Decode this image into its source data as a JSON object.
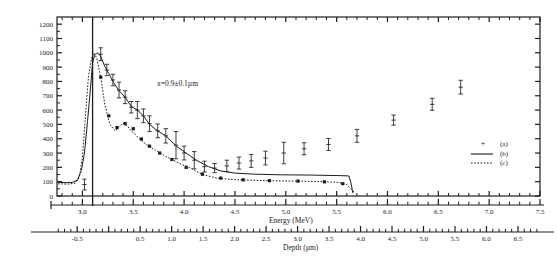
{
  "chart_data": {
    "type": "line",
    "title": "",
    "annotation": "x=0.9±0.1µm",
    "xlabel": "Energy (MeV)",
    "xlabel2": "Depth (µm)",
    "ylabel": "",
    "xlim": [
      2.75,
      7.5
    ],
    "ylim": [
      0,
      1250
    ],
    "xlim_depth": [
      -0.82,
      6.85
    ],
    "grid": false,
    "legend_position": "lower-right",
    "vertical_marker_energy": 3.1,
    "ytick_labels": [
      "0",
      "100",
      "200",
      "300",
      "400",
      "500",
      "600",
      "700",
      "800",
      "900",
      "1000",
      "1100",
      "1200"
    ],
    "ytick_values": [
      0,
      100,
      200,
      300,
      400,
      500,
      600,
      700,
      800,
      900,
      1000,
      1100,
      1200
    ],
    "xtick_labels": [
      "3.0",
      "3.5",
      "4.0",
      "4.5",
      "5.0",
      "5.5",
      "6.0",
      "6.5",
      "7.0",
      "7.5"
    ],
    "xtick_values": [
      3.0,
      3.5,
      4.0,
      4.5,
      5.0,
      5.5,
      6.0,
      6.5,
      7.0,
      7.5
    ],
    "xtick_minor_step": 0.1,
    "depth_tick_labels": [
      "-0.5",
      "0.5",
      "1.0",
      "1.5",
      "2.0",
      "2.5",
      "3.0",
      "3.5",
      "4.0",
      "4.5",
      "5.0",
      "5.5",
      "6.0",
      "6.5"
    ],
    "depth_tick_values": [
      -0.5,
      0.5,
      1.0,
      1.5,
      2.0,
      2.5,
      3.0,
      3.5,
      4.0,
      4.5,
      5.0,
      5.5,
      6.0,
      6.5
    ],
    "depth_tick_minor_step": 0.1,
    "legend": [
      {
        "marker": "+",
        "label": "(a)"
      },
      {
        "marker": "solid-line",
        "label": "(b)"
      },
      {
        "marker": "dotted-line",
        "label": "(c)"
      }
    ],
    "series": [
      {
        "name": "(a)",
        "style": "points-with-errorbars",
        "x": [
          3.02,
          3.18,
          3.24,
          3.3,
          3.36,
          3.42,
          3.48,
          3.54,
          3.6,
          3.66,
          3.74,
          3.82,
          3.92,
          4.0,
          4.1,
          4.2,
          4.3,
          4.42,
          4.54,
          4.66,
          4.8,
          4.98,
          5.18,
          5.42,
          5.7,
          6.06,
          6.44,
          6.72
        ],
        "y": [
          80,
          990,
          880,
          810,
          740,
          690,
          620,
          600,
          560,
          505,
          455,
          420,
          355,
          300,
          250,
          205,
          195,
          210,
          230,
          245,
          265,
          300,
          330,
          360,
          420,
          530,
          640,
          760
        ],
        "yerr": [
          38,
          45,
          40,
          40,
          55,
          45,
          40,
          60,
          48,
          55,
          48,
          50,
          95,
          48,
          60,
          38,
          32,
          40,
          42,
          45,
          48,
          75,
          42,
          42,
          45,
          35,
          42,
          48
        ]
      },
      {
        "name": "(b)",
        "style": "solid-line",
        "x": [
          2.76,
          2.84,
          2.9,
          2.95,
          2.99,
          3.02,
          3.05,
          3.08,
          3.1,
          3.12,
          3.15,
          3.18,
          3.22,
          3.26,
          3.3,
          3.36,
          3.42,
          3.48,
          3.54,
          3.6,
          3.66,
          3.74,
          3.82,
          3.92,
          4.02,
          4.12,
          4.24,
          4.36,
          4.5,
          4.7,
          4.95,
          5.25,
          5.55,
          5.62,
          5.64,
          5.66
        ],
        "y": [
          95,
          93,
          95,
          110,
          180,
          300,
          520,
          760,
          930,
          985,
          1000,
          975,
          905,
          855,
          800,
          735,
          690,
          625,
          600,
          560,
          500,
          455,
          420,
          350,
          300,
          250,
          205,
          175,
          160,
          152,
          148,
          146,
          142,
          140,
          95,
          20
        ]
      },
      {
        "name": "(c)",
        "style": "dotted-line-with-markers",
        "x": [
          2.76,
          2.86,
          2.93,
          2.97,
          3.0,
          3.03,
          3.06,
          3.09,
          3.11,
          3.14,
          3.18,
          3.22,
          3.27,
          3.32,
          3.36,
          3.4,
          3.44,
          3.48,
          3.52,
          3.56,
          3.6,
          3.66,
          3.72,
          3.8,
          3.88,
          3.96,
          4.06,
          4.18,
          4.32,
          4.48,
          4.66,
          4.88,
          5.12,
          5.36,
          5.52,
          5.6,
          5.68
        ],
        "y": [
          85,
          83,
          90,
          130,
          270,
          560,
          840,
          960,
          1000,
          965,
          830,
          640,
          500,
          455,
          480,
          510,
          490,
          455,
          430,
          400,
          375,
          345,
          320,
          285,
          255,
          225,
          195,
          150,
          125,
          115,
          110,
          106,
          104,
          100,
          95,
          80,
          20
        ],
        "marker_x": [
          3.18,
          3.26,
          3.34,
          3.42,
          3.5,
          3.58,
          3.66,
          3.76,
          3.88,
          4.02,
          4.18,
          4.36,
          4.58,
          4.84,
          5.12,
          5.38,
          5.56
        ],
        "marker_y": [
          830,
          560,
          478,
          505,
          470,
          398,
          348,
          300,
          255,
          200,
          152,
          125,
          113,
          107,
          104,
          99,
          86
        ]
      }
    ]
  },
  "legend_block": {
    "entries": [
      "(a)",
      "(b)",
      "(c)"
    ]
  }
}
